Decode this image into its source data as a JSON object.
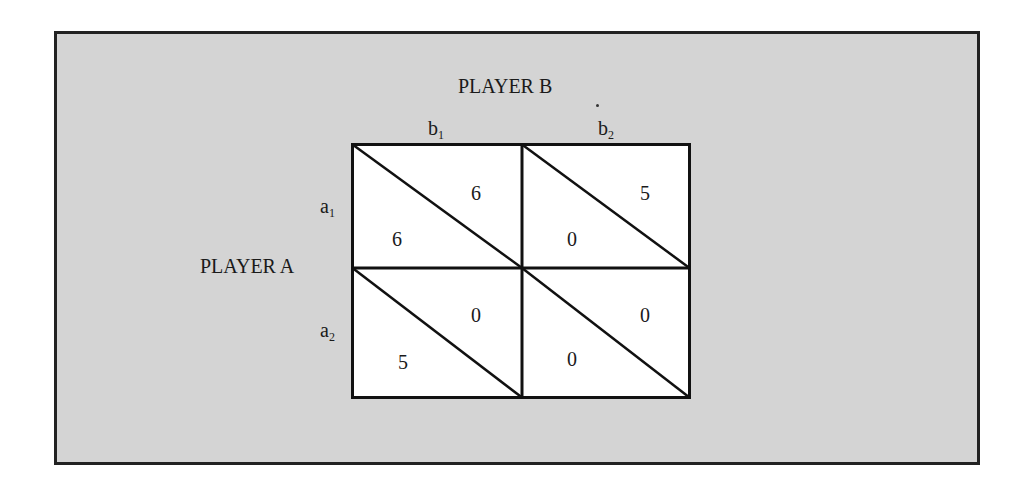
{
  "player_b": {
    "label": "PLAYER B",
    "strategies": [
      {
        "base": "b",
        "sub": "1"
      },
      {
        "base": "b",
        "sub": "2"
      }
    ]
  },
  "player_a": {
    "label": "PLAYER A",
    "strategies": [
      {
        "base": "a",
        "sub": "1"
      },
      {
        "base": "a",
        "sub": "2"
      }
    ]
  },
  "matrix": {
    "cells": [
      {
        "row": "a1",
        "col": "b1",
        "a_payoff": "6",
        "b_payoff": "6"
      },
      {
        "row": "a1",
        "col": "b2",
        "a_payoff": "0",
        "b_payoff": "5"
      },
      {
        "row": "a2",
        "col": "b1",
        "a_payoff": "5",
        "b_payoff": "0"
      },
      {
        "row": "a2",
        "col": "b2",
        "a_payoff": "0",
        "b_payoff": "0"
      }
    ]
  },
  "colors": {
    "background": "#d4d4d4",
    "cell": "#ffffff",
    "line": "#111111"
  }
}
